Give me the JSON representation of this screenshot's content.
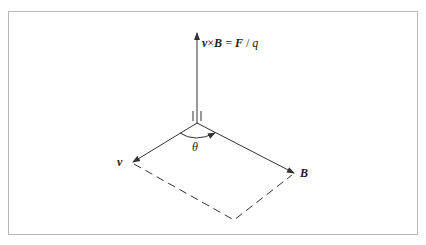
{
  "figure": {
    "labels": {
      "force": {
        "v": "v",
        "times": "×",
        "B": "B",
        "eq": " = ",
        "F": "F",
        "slash": " / ",
        "q": "q"
      },
      "v": "v",
      "B": "B",
      "theta": "θ"
    },
    "colors": {
      "stroke": "#333333",
      "border": "#b8b8b8"
    }
  }
}
